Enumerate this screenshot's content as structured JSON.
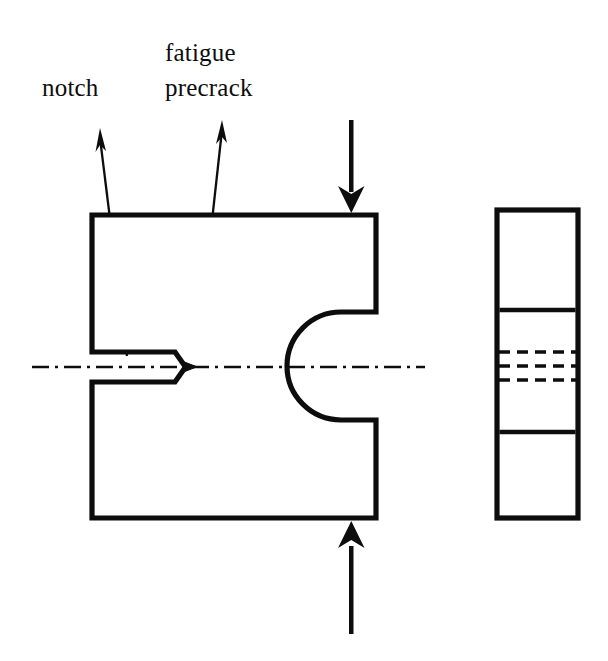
{
  "figure": {
    "type": "engineering-diagram",
    "background_color": "#ffffff",
    "line_color": "#0d0d0d",
    "labels": {
      "notch": "notch",
      "fatigue_line1": "fatigue",
      "fatigue_line2": "precrack"
    },
    "front_view": {
      "name": "C-shaped compact tension specimen front view",
      "outline_stroke_width": 5,
      "left_edge_x": 92,
      "right_edge_x": 376,
      "top_edge_y": 215,
      "bottom_edge_y": 518,
      "upper_arm_inner_y": 312,
      "lower_arm_inner_y": 420,
      "notch": {
        "slot_start_x": 92,
        "slot_end_x": 175,
        "slot_top_y": 352,
        "slot_bottom_y": 382,
        "apex_x": 185,
        "apex_y": 367
      },
      "precrack": {
        "tip_x": 196,
        "root_x": 185,
        "center_y": 367,
        "half_height": 4
      },
      "circular_cutout": {
        "center_x": 303,
        "center_y": 367,
        "radius": 38,
        "opening": "right"
      },
      "centerline": {
        "y": 367,
        "start_x": 32,
        "end_x": 425,
        "style": "dash-dot"
      }
    },
    "side_view": {
      "name": "specimen side view",
      "left_edge_x": 497,
      "right_edge_x": 578,
      "top_edge_y": 210,
      "bottom_edge_y": 518,
      "solid_divider_y": [
        310,
        432
      ],
      "dashed_line_y": [
        352,
        366,
        380
      ],
      "outline_stroke_width": 5
    },
    "load_arrows": [
      {
        "name": "upper-load-arrow",
        "direction": "down",
        "x": 351,
        "tail_y": 120,
        "tip_y": 213,
        "shaft_width": 4,
        "head_half_width": 13,
        "head_length": 26
      },
      {
        "name": "lower-load-arrow",
        "direction": "up",
        "x": 351,
        "tail_y": 634,
        "tip_y": 521,
        "shaft_width": 4,
        "head_half_width": 13,
        "head_length": 26
      }
    ],
    "leader_arrows": [
      {
        "name": "notch-leader-arrow",
        "tip_x": 100,
        "tip_y": 130,
        "tail_x": 127,
        "tail_y": 356,
        "stroke_width": 2
      },
      {
        "name": "precrack-leader-arrow",
        "tip_x": 222,
        "tip_y": 122,
        "tail_x": 196,
        "tail_y": 366,
        "stroke_width": 2
      }
    ],
    "label_positions": {
      "notch": {
        "x": 42,
        "y": 96
      },
      "fatigue_line1": {
        "x": 165,
        "y": 61
      },
      "fatigue_line2": {
        "x": 165,
        "y": 96
      }
    }
  }
}
